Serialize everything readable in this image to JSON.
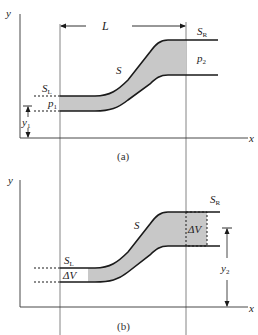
{
  "colors": {
    "line": "#1a1a1a",
    "fill": "#cccccc",
    "guide": "#555555"
  },
  "panel_a": {
    "caption": "(a)",
    "x_axis_label": "x",
    "y_axis_label": "y",
    "length_label": "L",
    "left_surface_label": "S",
    "left_surface_sub": "L",
    "right_surface_label": "S",
    "right_surface_sub": "R",
    "side_surface_label": "S",
    "left_pressure_label": "p",
    "left_pressure_sub": "1",
    "right_pressure_label": "p",
    "right_pressure_sub": "2",
    "left_height_label": "y",
    "left_height_sub": "1"
  },
  "panel_b": {
    "caption": "(b)",
    "x_axis_label": "x",
    "y_axis_label": "y",
    "left_surface_label": "S",
    "left_surface_sub": "L",
    "right_surface_label": "S",
    "right_surface_sub": "R",
    "side_surface_label": "S",
    "left_volume_label": "ΔV",
    "right_volume_label": "ΔV",
    "right_height_label": "y",
    "right_height_sub": "2"
  }
}
